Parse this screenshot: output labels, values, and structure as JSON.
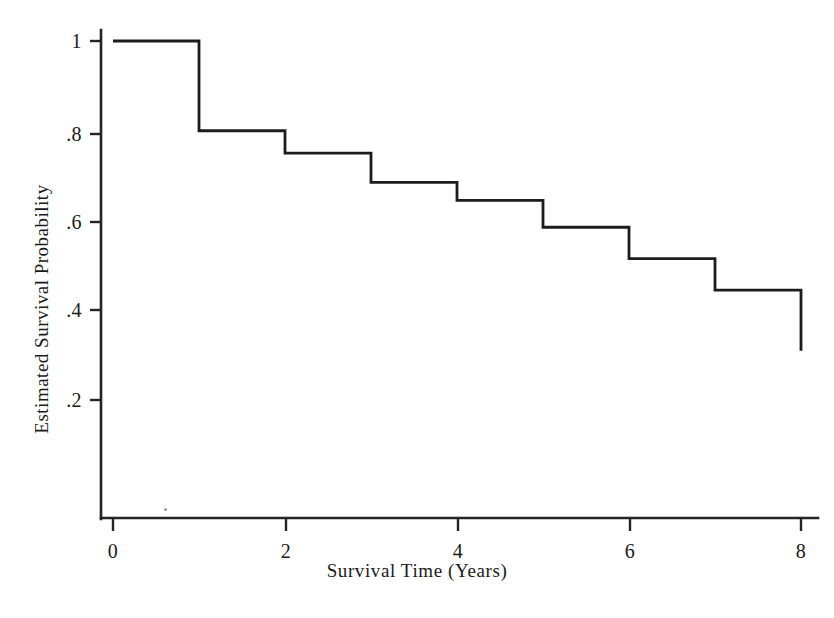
{
  "figure": {
    "background_color": "#ffffff",
    "line_color": "#1c1c1c",
    "axis_color": "#242424"
  },
  "chart_data": {
    "type": "line",
    "subtype": "kaplan-meier-step-survival-curve",
    "title": "",
    "xlabel": "Survival Time (Years)",
    "ylabel": "Estimated Survival Probability",
    "xlim": [
      0,
      8
    ],
    "ylim": [
      0,
      1
    ],
    "grid": false,
    "legend": "none",
    "xticks": [
      0,
      2,
      4,
      6,
      8
    ],
    "xtick_labels": [
      "0",
      "2",
      "4",
      "6",
      "8"
    ],
    "yticks": [
      0.2,
      0.4,
      0.6,
      0.8,
      1
    ],
    "ytick_labels": [
      ".2",
      ".4",
      ".6",
      ".8",
      "1"
    ],
    "x": [
      0,
      1,
      2,
      3,
      4,
      5,
      6,
      7,
      8
    ],
    "values": [
      1.0,
      0.8,
      0.75,
      0.685,
      0.645,
      0.585,
      0.515,
      0.445,
      0.31
    ],
    "steps": [
      {
        "x_start": 0,
        "x_end": 1,
        "survival": 1.0
      },
      {
        "x_start": 1,
        "x_end": 2,
        "survival": 0.8
      },
      {
        "x_start": 2,
        "x_end": 3,
        "survival": 0.75
      },
      {
        "x_start": 3,
        "x_end": 4,
        "survival": 0.685
      },
      {
        "x_start": 4,
        "x_end": 5,
        "survival": 0.645
      },
      {
        "x_start": 5,
        "x_end": 6,
        "survival": 0.585
      },
      {
        "x_start": 6,
        "x_end": 7,
        "survival": 0.515
      },
      {
        "x_start": 7,
        "x_end": 8,
        "survival": 0.445
      },
      {
        "x_start": 8,
        "x_end": 8,
        "survival": 0.31
      }
    ],
    "terminal_drop_to": 0.31,
    "annotations": []
  },
  "axes": {
    "x_title": "Survival Time (Years)",
    "y_title": "Estimated Survival Probability",
    "x_labels": [
      "0",
      "2",
      "4",
      "6",
      "8"
    ],
    "y_labels": [
      "1",
      ".8",
      ".6",
      ".4",
      ".2"
    ]
  }
}
